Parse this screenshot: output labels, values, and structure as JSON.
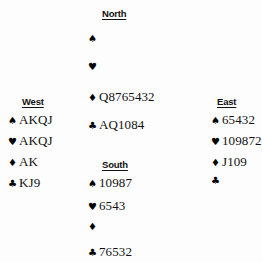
{
  "diagram": {
    "type": "bridge-hand-diagram",
    "suit_symbols": {
      "spade": "♠",
      "heart": "♥",
      "diamond": "♦",
      "club": "♣"
    },
    "colors": {
      "background": "#fdfdfd",
      "text": "#111111",
      "suit": "#000000"
    },
    "hands": {
      "north": {
        "label": "North",
        "spades": "",
        "hearts": "",
        "diamonds": "Q8765432",
        "clubs": "AQ1084"
      },
      "west": {
        "label": "West",
        "spades": "AKQJ",
        "hearts": "AKQJ",
        "diamonds": "AK",
        "clubs": "KJ9"
      },
      "east": {
        "label": "East",
        "spades": "65432",
        "hearts": "109872",
        "diamonds": "J109",
        "clubs": ""
      },
      "south": {
        "label": "South",
        "spades": "10987",
        "hearts": "6543",
        "diamonds": "",
        "clubs": "76532"
      }
    }
  }
}
